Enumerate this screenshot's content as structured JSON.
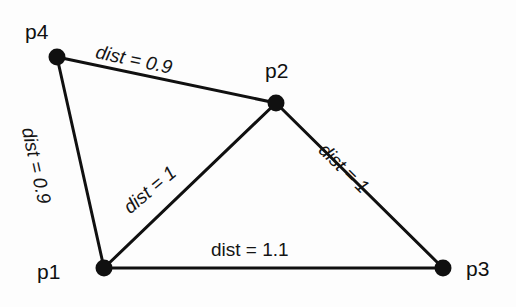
{
  "figure": {
    "type": "node-link-graph",
    "background_color": "#fdfdfd",
    "stroke_color": "#101010",
    "node_fill_color": "#101010",
    "node_radius_px": 8,
    "edge_width_px": 3,
    "width_px": 516,
    "height_px": 307
  },
  "nodes": [
    {
      "id": "p4",
      "label": "p4",
      "x": 57,
      "y": 57
    },
    {
      "id": "p2",
      "label": "p2",
      "x": 276,
      "y": 103
    },
    {
      "id": "p1",
      "label": "p1",
      "x": 104,
      "y": 268
    },
    {
      "id": "p3",
      "label": "p3",
      "x": 443,
      "y": 268
    }
  ],
  "edges": [
    {
      "id": "p4-p2",
      "from": "p4",
      "to": "p2",
      "label": "dist = 0.9",
      "value": 0.9,
      "orientation": "italic-rotated"
    },
    {
      "id": "p4-p1",
      "from": "p4",
      "to": "p1",
      "label": "dist = 0.9",
      "value": 0.9,
      "orientation": "italic-rotated"
    },
    {
      "id": "p1-p2",
      "from": "p1",
      "to": "p2",
      "label": "dist = 1",
      "value": 1.0,
      "orientation": "italic-rotated"
    },
    {
      "id": "p2-p3",
      "from": "p2",
      "to": "p3",
      "label": "dist = 1",
      "value": 1.0,
      "orientation": "italic-rotated"
    },
    {
      "id": "p1-p3",
      "from": "p1",
      "to": "p3",
      "label": "dist = 1.1",
      "value": 1.1,
      "orientation": "upright"
    }
  ]
}
